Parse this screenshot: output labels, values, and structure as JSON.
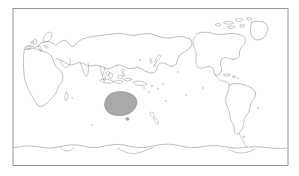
{
  "figure": {
    "kind": "world-map",
    "projection": "equirectangular",
    "center_meridian": "Pacific-centered",
    "background_color": "#ffffff",
    "frame": {
      "visible": true,
      "stroke_color": "#8c8c8c",
      "x": 13,
      "y": 8.5,
      "width": 275,
      "height": 157
    },
    "coastline_color": "#6f6f6f",
    "highlight_color": "#a9a9a9",
    "labels_visible": false,
    "graticule_visible": false,
    "legend_visible": false,
    "title": ""
  },
  "highlighted_regions": [
    {
      "name": "Australia",
      "fill": "#a9a9a9",
      "outline": "#6f6f6f"
    }
  ],
  "landmasses": [
    {
      "name": "Africa",
      "filled": false
    },
    {
      "name": "Europe",
      "filled": false
    },
    {
      "name": "Asia",
      "filled": false
    },
    {
      "name": "Russia",
      "filled": false
    },
    {
      "name": "Arabian Peninsula",
      "filled": false
    },
    {
      "name": "India",
      "filled": false
    },
    {
      "name": "Southeast Asia",
      "filled": false
    },
    {
      "name": "Indonesia",
      "filled": false
    },
    {
      "name": "New Guinea",
      "filled": false
    },
    {
      "name": "Japan",
      "filled": false
    },
    {
      "name": "Australia",
      "filled": true
    },
    {
      "name": "New Zealand",
      "filled": false
    },
    {
      "name": "North America",
      "filled": false
    },
    {
      "name": "Greenland",
      "filled": false
    },
    {
      "name": "Central America",
      "filled": false
    },
    {
      "name": "South America",
      "filled": false
    },
    {
      "name": "Antarctica",
      "filled": false
    },
    {
      "name": "Madagascar",
      "filled": false
    },
    {
      "name": "United Kingdom",
      "filled": false
    },
    {
      "name": "Philippines",
      "filled": false
    }
  ],
  "oceans": [
    {
      "name": "Pacific Ocean"
    },
    {
      "name": "Atlantic Ocean"
    },
    {
      "name": "Indian Ocean"
    },
    {
      "name": "Arctic Ocean"
    },
    {
      "name": "Southern Ocean"
    }
  ]
}
